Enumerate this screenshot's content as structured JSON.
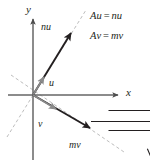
{
  "figure": {
    "background_color": "#ffffff",
    "axes": {
      "x_label": "x",
      "y_label": "y",
      "axis_color": "#595959",
      "origin": {
        "x": 33,
        "y": 95
      },
      "x_axis": {
        "start_x": 8,
        "end_x": 122,
        "y": 95
      },
      "y_axis": {
        "x": 33,
        "start_y": 15,
        "end_y": 160
      }
    },
    "equations": [
      {
        "lhs_scalar": "A",
        "lhs_vector": "u",
        "operator": "=",
        "rhs_scalar": "n",
        "rhs_vector": "u"
      },
      {
        "lhs_scalar": "A",
        "lhs_vector": "v",
        "operator": "=",
        "rhs_scalar": "m",
        "rhs_vector": "v"
      }
    ],
    "vectors": [
      {
        "name": "u",
        "label_scalar": "",
        "label_vector": "u",
        "color": "#808080",
        "weight": "light",
        "from": {
          "x": 33,
          "y": 95
        },
        "to": {
          "x": 46,
          "y": 74
        }
      },
      {
        "name": "nu",
        "label_scalar": "n",
        "label_vector": "u",
        "color": "#231f20",
        "weight": "heavy",
        "from": {
          "x": 33,
          "y": 95
        },
        "to": {
          "x": 74,
          "y": 29
        }
      },
      {
        "name": "v",
        "label_scalar": "",
        "label_vector": "v",
        "color": "#808080",
        "weight": "light",
        "from": {
          "x": 33,
          "y": 95
        },
        "to": {
          "x": 60,
          "y": 114
        }
      },
      {
        "name": "mv",
        "label_scalar": "m",
        "label_vector": "v",
        "color": "#231f20",
        "weight": "heavy",
        "from": {
          "x": 33,
          "y": 95
        },
        "to": {
          "x": 94,
          "y": 131
        }
      }
    ],
    "dashed_lines": [
      {
        "name": "u-span-line",
        "x1": 7,
        "y1": 137,
        "x2": 86,
        "y2": 10,
        "color": "#b3b3b3"
      },
      {
        "name": "v-span-line",
        "x1": 11,
        "y1": 75,
        "x2": 124,
        "y2": 152,
        "color": "#b3b3b3"
      }
    ],
    "labels": {
      "y_axis": "y",
      "x_axis": "x",
      "nu": "nu",
      "u": "u",
      "v": "v",
      "mv": "mv"
    }
  }
}
